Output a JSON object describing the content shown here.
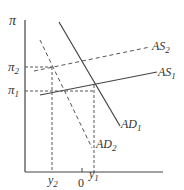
{
  "diagram": {
    "type": "AS-AD model",
    "y_axis_label": "π",
    "x_axis_label": "",
    "y_ticks": [
      {
        "label": "π",
        "sub": "2",
        "id": "pi2"
      },
      {
        "label": "π",
        "sub": "1",
        "id": "pi1"
      }
    ],
    "x_ticks": [
      {
        "label": "y",
        "sub": "2",
        "id": "y2"
      },
      {
        "label": "0",
        "sub": "",
        "id": "zero"
      },
      {
        "label": "y",
        "sub": "1",
        "id": "y1"
      }
    ],
    "curves": [
      {
        "name": "AS",
        "sub": "2",
        "style": "dashed",
        "slope": "upward"
      },
      {
        "name": "AS",
        "sub": "1",
        "style": "solid",
        "slope": "upward"
      },
      {
        "name": "AD",
        "sub": "1",
        "style": "solid",
        "slope": "downward"
      },
      {
        "name": "AD",
        "sub": "2",
        "style": "dashed",
        "slope": "downward"
      }
    ],
    "colors": {
      "line": "#444444",
      "text": "#333333",
      "background": "#ffffff"
    }
  }
}
